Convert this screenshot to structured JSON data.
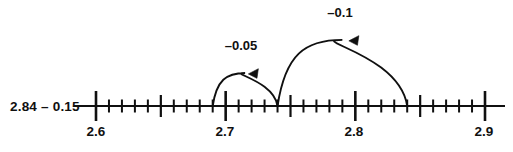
{
  "figure": {
    "type": "number-line-subtraction-diagram",
    "expression_label": "2.84 – 0.15",
    "line": {
      "start_value": 2.57,
      "end_value": 2.925,
      "x_start_px": 74,
      "x_end_px": 505,
      "y_px": 106
    },
    "axis": {
      "min": 2.6,
      "max": 2.9,
      "minor_step": 0.01,
      "medium_step": 0.05,
      "major_step": 0.1
    },
    "major_ticks": [
      {
        "value": 2.6,
        "label": "2.6"
      },
      {
        "value": 2.7,
        "label": "2.7"
      },
      {
        "value": 2.8,
        "label": "2.8"
      },
      {
        "value": 2.9,
        "label": "2.9"
      }
    ],
    "medium_ticks": [
      2.65,
      2.75,
      2.85
    ],
    "jumps": [
      {
        "name": "jump-minus-0-05",
        "label": "–0.05",
        "from_value": 2.74,
        "to_value": 2.69,
        "amount": -0.05,
        "direction": "left",
        "arrowhead": "left"
      },
      {
        "name": "jump-minus-0-1",
        "label": "–0.1",
        "from_value": 2.84,
        "to_value": 2.74,
        "amount": -0.1,
        "direction": "left",
        "arrowhead": "left"
      }
    ],
    "colors": {
      "ink": "#101010",
      "background": "#ffffff"
    }
  },
  "chart_data": {
    "type": "line",
    "title": "2.84 – 0.15",
    "xlabel": "",
    "ylabel": "",
    "xlim": [
      2.57,
      2.925
    ],
    "categories": [
      "2.6",
      "2.7",
      "2.8",
      "2.9"
    ],
    "values": [
      2.6,
      2.7,
      2.8,
      2.9
    ],
    "annotations": [
      {
        "text": "–0.05",
        "from": 2.74,
        "to": 2.69
      },
      {
        "text": "–0.1",
        "from": 2.84,
        "to": 2.74
      }
    ],
    "grid": false,
    "legend": "none"
  }
}
